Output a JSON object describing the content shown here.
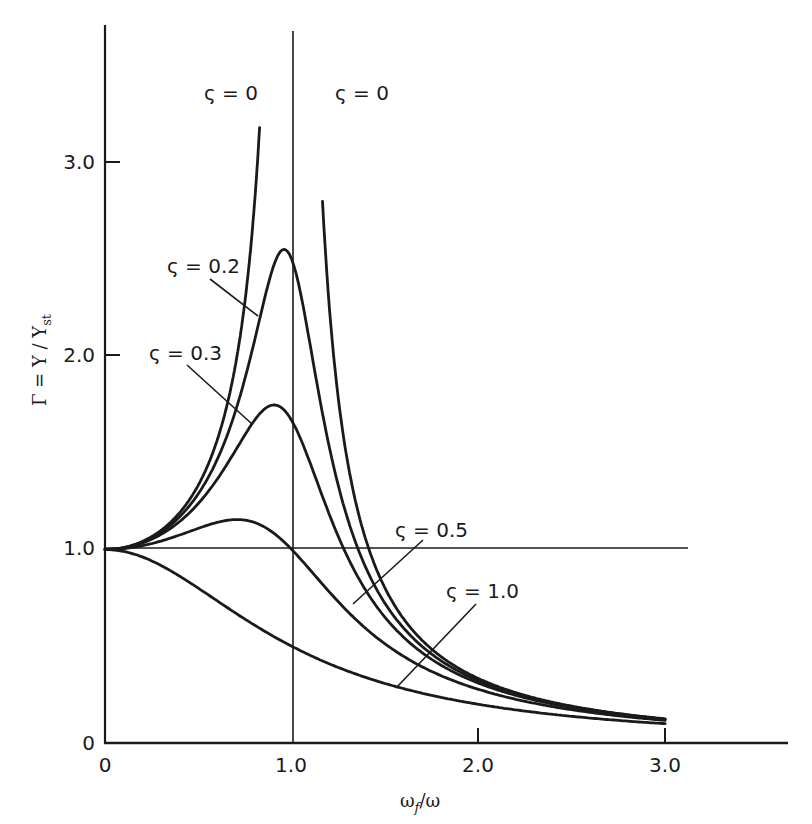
{
  "chart_data": {
    "type": "line",
    "title": "",
    "xlabel": "ω_f/ω",
    "ylabel": "Γ = Y/Y_st",
    "xlim": [
      0,
      3.6
    ],
    "ylim": [
      0,
      3.6
    ],
    "grid": false,
    "legend": "inline labels with leader lines",
    "x_ticks": [
      {
        "value": 0,
        "label": "0"
      },
      {
        "value": 1.0,
        "label": "1.0"
      },
      {
        "value": 2.0,
        "label": "2.0"
      },
      {
        "value": 3.0,
        "label": "3.0"
      }
    ],
    "y_ticks": [
      {
        "value": 0,
        "label": "0"
      },
      {
        "value": 1.0,
        "label": "1.0"
      },
      {
        "value": 2.0,
        "label": "2.0"
      },
      {
        "value": 3.0,
        "label": "3.0"
      }
    ],
    "reference_lines": [
      {
        "orientation": "horizontal",
        "value": 1.0,
        "x_extent": [
          0,
          3.1
        ]
      },
      {
        "orientation": "vertical",
        "value": 1.0,
        "y_extent": [
          0,
          3.65
        ]
      }
    ],
    "formula": "Γ = 1 / sqrt((1 - r^2)^2 + (2ζ r)^2), r = ω_f/ω",
    "series": [
      {
        "name": "ς = 0",
        "zeta": 0,
        "x": [
          0,
          0.2,
          0.4,
          0.5,
          0.6,
          0.7,
          0.75,
          0.8,
          0.83
        ],
        "values": [
          1.0,
          1.04,
          1.19,
          1.33,
          1.56,
          1.96,
          2.29,
          2.78,
          3.23
        ],
        "note": "left branch, asymptotic at r=1"
      },
      {
        "name": "ς = 0",
        "zeta": 0,
        "x": [
          1.17,
          1.2,
          1.3,
          1.4,
          1.5,
          1.75,
          2.0,
          2.5,
          3.0
        ],
        "values": [
          2.71,
          2.27,
          1.45,
          1.04,
          0.8,
          0.48,
          0.33,
          0.19,
          0.125
        ],
        "note": "right branch, asymptotic at r=1"
      },
      {
        "name": "ς = 0.2",
        "zeta": 0.2,
        "x": [
          0,
          0.2,
          0.4,
          0.6,
          0.8,
          0.9,
          0.96,
          1.0,
          1.1,
          1.2,
          1.4,
          1.6,
          2.0,
          2.5,
          3.0
        ],
        "values": [
          1.0,
          1.04,
          1.18,
          1.49,
          2.15,
          2.55,
          2.56,
          2.5,
          1.96,
          1.45,
          0.91,
          0.62,
          0.32,
          0.19,
          0.12
        ]
      },
      {
        "name": "ς = 0.3",
        "zeta": 0.3,
        "x": [
          0,
          0.2,
          0.4,
          0.6,
          0.8,
          0.9,
          1.0,
          1.1,
          1.2,
          1.4,
          1.6,
          2.0,
          2.5,
          3.0
        ],
        "values": [
          1.0,
          1.04,
          1.16,
          1.41,
          1.72,
          1.75,
          1.67,
          1.45,
          1.19,
          0.81,
          0.58,
          0.32,
          0.19,
          0.12
        ]
      },
      {
        "name": "ς = 0.5",
        "zeta": 0.5,
        "x": [
          0,
          0.2,
          0.4,
          0.6,
          0.7,
          0.8,
          1.0,
          1.2,
          1.4,
          1.6,
          2.0,
          2.5,
          3.0
        ],
        "values": [
          1.0,
          1.02,
          1.09,
          1.15,
          1.15,
          1.1,
          1.0,
          0.76,
          0.58,
          0.45,
          0.28,
          0.18,
          0.12
        ]
      },
      {
        "name": "ς = 1.0",
        "zeta": 1.0,
        "x": [
          0,
          0.25,
          0.5,
          0.75,
          1.0,
          1.25,
          1.5,
          2.0,
          2.5,
          3.0
        ],
        "values": [
          1.0,
          0.94,
          0.8,
          0.64,
          0.5,
          0.39,
          0.31,
          0.2,
          0.14,
          0.1
        ]
      }
    ],
    "annotations": [
      {
        "text": "ς = 0",
        "position": "left of left ζ=0 branch"
      },
      {
        "text": "ς = 0",
        "position": "right of right ζ=0 branch"
      },
      {
        "text": "ς = 0.2",
        "leader_to": [
          0.82,
          2.3
        ]
      },
      {
        "text": "ς = 0.3",
        "leader_to": [
          0.79,
          1.65
        ]
      },
      {
        "text": "ς = 0.5",
        "leader_to": [
          1.33,
          0.72
        ]
      },
      {
        "text": "ς = 1.0",
        "leader_to": [
          1.56,
          0.29
        ]
      }
    ]
  },
  "labels": {
    "xlabel_main": "ω",
    "xlabel_sub": "f",
    "xlabel_tail": "/ω",
    "ylabel_main": "Γ = Y / Y",
    "ylabel_sub": "st",
    "x_tick_0": "0",
    "x_tick_1": "1.0",
    "x_tick_2": "2.0",
    "x_tick_3": "3.0",
    "y_tick_0": "0",
    "y_tick_1": "1.0",
    "y_tick_2": "2.0",
    "y_tick_3": "3.0",
    "zeta0_left": "ς = 0",
    "zeta0_right": "ς = 0",
    "zeta02": "ς = 0.2",
    "zeta03": "ς = 0.3",
    "zeta05": "ς = 0.5",
    "zeta10": "ς = 1.0"
  }
}
